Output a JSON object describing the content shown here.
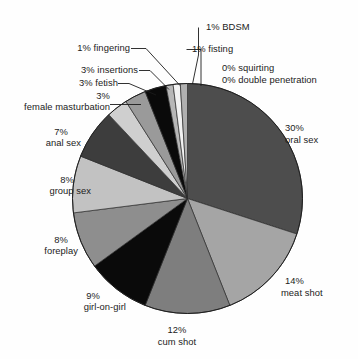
{
  "chart_data": {
    "type": "pie",
    "title": "",
    "subtitle": "",
    "xlabel": "",
    "ylabel": "",
    "legend_position": "none",
    "grid": false,
    "start_angle_deg": 0,
    "direction": "clockwise",
    "units": "percent",
    "total": 100,
    "categories": [
      "oral sex",
      "meat shot",
      "cum shot",
      "girl-on-girl",
      "foreplay",
      "group sex",
      "anal sex",
      "female masturbation",
      "fetish",
      "insertions",
      "fingering",
      "BDSM",
      "fisting",
      "squirting",
      "double penetration"
    ],
    "values": [
      30,
      14,
      12,
      9,
      8,
      8,
      7,
      3,
      3,
      3,
      1,
      1,
      1,
      0,
      0
    ],
    "slice_colors": [
      "#4d4d4d",
      "#a5a5a5",
      "#7e7e7e",
      "#0a0a0a",
      "#8e8e8e",
      "#c2c2c2",
      "#3d3d3d",
      "#cfcfcf",
      "#9a9a9a",
      "#0a0a0a",
      "#b7b7b7",
      "#f2f2f2",
      "#b0b0b0"
    ],
    "slices": [
      {
        "label": "oral sex",
        "percent_text": "30%",
        "name_text": "oral sex",
        "value": 30,
        "color": "#4d4d4d"
      },
      {
        "label": "meat shot",
        "percent_text": "14%",
        "name_text": "meat shot",
        "value": 14,
        "color": "#a5a5a5"
      },
      {
        "label": "cum shot",
        "percent_text": "12%",
        "name_text": "cum shot",
        "value": 12,
        "color": "#7e7e7e"
      },
      {
        "label": "girl-on-girl",
        "percent_text": "9%",
        "name_text": "girl-on-girl",
        "value": 9,
        "color": "#0a0a0a"
      },
      {
        "label": "foreplay",
        "percent_text": "8%",
        "name_text": "foreplay",
        "value": 8,
        "color": "#8e8e8e"
      },
      {
        "label": "group sex",
        "percent_text": "8%",
        "name_text": "group sex",
        "value": 8,
        "color": "#c2c2c2"
      },
      {
        "label": "anal sex",
        "percent_text": "7%",
        "name_text": "anal sex",
        "value": 7,
        "color": "#3d3d3d"
      },
      {
        "label": "female masturbation",
        "percent_text": "3%",
        "name_text": "female masturbation",
        "value": 3,
        "color": "#cfcfcf"
      },
      {
        "label": "fetish",
        "percent_text": "3%",
        "name_text": "fetish",
        "value": 3,
        "color": "#9a9a9a"
      },
      {
        "label": "insertions",
        "percent_text": "3%",
        "name_text": "insertions",
        "value": 3,
        "color": "#0a0a0a"
      },
      {
        "label": "fingering",
        "percent_text": "1%",
        "name_text": "fingering",
        "value": 1,
        "color": "#b7b7b7"
      },
      {
        "label": "BDSM",
        "percent_text": "1%",
        "name_text": "BDSM",
        "value": 1,
        "color": "#f2f2f2"
      },
      {
        "label": "fisting",
        "percent_text": "1%",
        "name_text": "fisting",
        "value": 1,
        "color": "#b0b0b0"
      },
      {
        "label": "squirting",
        "percent_text": "0%",
        "name_text": "squirting",
        "value": 0,
        "color": "#ffffff"
      },
      {
        "label": "double penetration",
        "percent_text": "0%",
        "name_text": "double penetration",
        "value": 0,
        "color": "#ffffff"
      }
    ]
  },
  "labels": {
    "bdsm": "1% BDSM",
    "fisting": "1% fisting",
    "fingering": "1% fingering",
    "insertions": "3% insertions",
    "fetish": "3% fetish",
    "female_masturbation_pct": "3%",
    "female_masturbation_name": "female masturbation",
    "anal_pct": "7%",
    "anal_name": "anal sex",
    "group_pct": "8%",
    "group_name": "group sex",
    "foreplay_pct": "8%",
    "foreplay_name": "foreplay",
    "girl_on_girl_pct": "9%",
    "girl_on_girl_name": "girl-on-girl",
    "cum_shot_pct": "12%",
    "cum_shot_name": "cum shot",
    "meat_shot_pct": "14%",
    "meat_shot_name": "meat shot",
    "oral_pct": "30%",
    "oral_name": "oral sex",
    "squirting": "0% squirting",
    "double_penetration": "0% double penetration"
  }
}
